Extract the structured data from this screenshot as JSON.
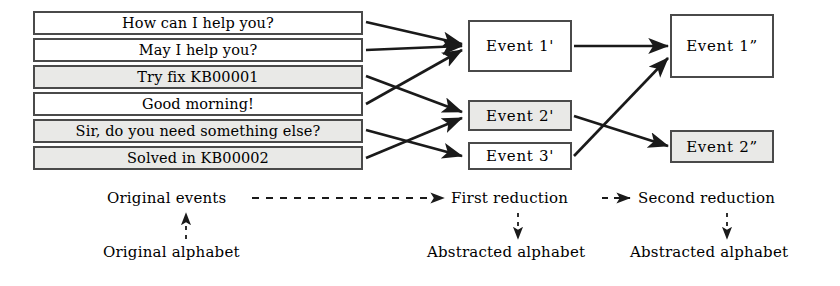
{
  "diagram": {
    "original_events": [
      {
        "label": "How can I help you?",
        "shaded": false
      },
      {
        "label": "May I help you?",
        "shaded": false
      },
      {
        "label": "Try fix KB00001",
        "shaded": true
      },
      {
        "label": "Good morning!",
        "shaded": false
      },
      {
        "label": "Sir, do you need something else?",
        "shaded": true
      },
      {
        "label": "Solved in KB00002",
        "shaded": true
      }
    ],
    "first_reduction_events": [
      {
        "label": "Event 1'",
        "shaded": false
      },
      {
        "label": "Event 2'",
        "shaded": true
      },
      {
        "label": "Event 3'",
        "shaded": false
      }
    ],
    "second_reduction_events": [
      {
        "label": "Event 1”",
        "shaded": false
      },
      {
        "label": "Event 2”",
        "shaded": true
      }
    ],
    "stage_labels": {
      "original": "Original events",
      "first": "First reduction",
      "second": "Second reduction"
    },
    "alphabet_labels": {
      "original": "Original alphabet",
      "first": "Abstracted alphabet",
      "second": "Abstracted alphabet"
    },
    "colors": {
      "stroke": "#4a4a4a",
      "arrow": "#1a1a1a",
      "shade": "#e9e9e7",
      "text": "#000000"
    }
  }
}
